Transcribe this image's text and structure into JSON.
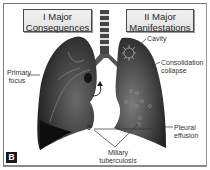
{
  "figure": {
    "panel_label": "B",
    "left_title": {
      "line1": "I Major",
      "line2": "Consequences"
    },
    "right_title": {
      "line1": "II Major",
      "line2": "Manifestations"
    }
  },
  "labels": {
    "primary_focus": {
      "line1": "Primary",
      "line2": "focus"
    },
    "cavity": "Cavity",
    "consolidation": {
      "line1": "Consolidation",
      "line2": "collapse"
    },
    "pleural_effusion": {
      "line1": "Pleural",
      "line2": "effusion"
    },
    "miliary": {
      "line1": "Miliary",
      "line2": "tuberculosis"
    },
    "marker_number": "5"
  },
  "colors": {
    "lung_dark": "#2e2e2e",
    "lung_mid": "#5a5a5a",
    "title_bg": "#e8e8e8",
    "frame": "#7a7a7a"
  }
}
